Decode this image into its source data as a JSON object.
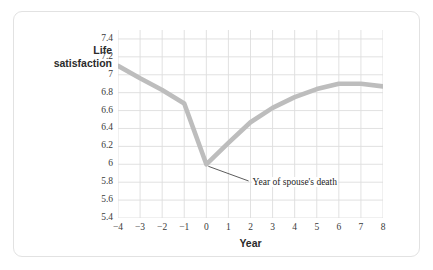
{
  "chart_data": {
    "type": "line",
    "title": "",
    "xlabel": "Year",
    "ylabel_lines": [
      "Life",
      "satisfaction"
    ],
    "ylabel": "Life satisfaction",
    "xlim": [
      -4,
      8
    ],
    "ylim": [
      5.4,
      7.5
    ],
    "grid": true,
    "legend": "none",
    "line_color": "#bdbdbd",
    "gridline_color": "#dedede",
    "background_color": "#ffffff",
    "border_color": "#e2e2e2",
    "x": [
      -4,
      -3,
      -2,
      -1,
      0,
      1,
      2,
      3,
      4,
      5,
      6,
      7,
      8
    ],
    "values": [
      7.1,
      6.96,
      6.83,
      6.68,
      6.0,
      6.24,
      6.47,
      6.63,
      6.75,
      6.84,
      6.9,
      6.9,
      6.87
    ],
    "xticks": [
      -4,
      -3,
      -2,
      -1,
      0,
      1,
      2,
      3,
      4,
      5,
      6,
      7,
      8
    ],
    "xtick_labels": [
      "−4",
      "−3",
      "−2",
      "−1",
      "0",
      "1",
      "2",
      "3",
      "4",
      "5",
      "6",
      "7",
      "8"
    ],
    "yticks": [
      5.4,
      5.6,
      5.8,
      6.0,
      6.2,
      6.4,
      6.6,
      6.8,
      7.0,
      7.2,
      7.4
    ],
    "ytick_labels": [
      "5.4",
      "5.6",
      "5.8",
      "6",
      "6.2",
      "6.4",
      "6.6",
      "6.8",
      "7",
      "7.2",
      "7.4"
    ],
    "annotations": [
      {
        "text": "Year of spouse's death",
        "points_to_x": 0,
        "points_to_y": 6.0,
        "label_x": 2.05,
        "label_y": 5.78
      }
    ]
  }
}
